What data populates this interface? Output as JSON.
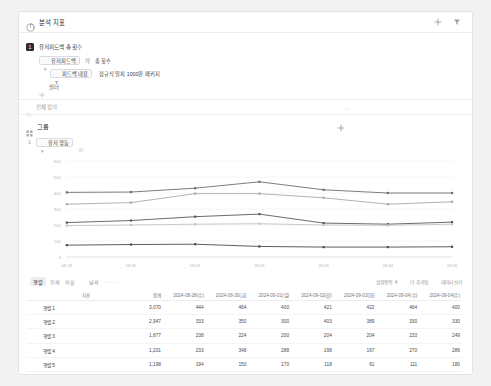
{
  "header": {
    "title": "분석 지표",
    "chart_icon": "chart-icon",
    "add_label": "+",
    "settings_icon": "funnel-icon"
  },
  "event": {
    "badge": "1",
    "title": "유저피드백 총 횟수",
    "property_chip": "유저피드백",
    "operator": "의",
    "metric": "총 횟수",
    "filter_chip": "피드백 내용",
    "filter_value": "정규식 일치 1000원 패키지",
    "add_filter_label": "필터"
  },
  "definition": {
    "label": "전체 정의",
    "icon": "search-icon",
    "caret": "chevron-down-icon"
  },
  "group": {
    "title": "그룹",
    "icon": "grid-icon",
    "add_label": "+",
    "items": [
      {
        "num": "1",
        "chip": "유저 행동",
        "gear": "gear-icon"
      }
    ]
  },
  "table_toolbar": {
    "tab": "행렬",
    "opt1": "전체",
    "opt2": "비율",
    "opt3": "날짜",
    "dots": "· · · · ·",
    "right": [
      "상위항목: 4",
      "더 추가됨",
      "데이터 보기"
    ]
  },
  "table": {
    "columns": [
      "",
      "지표",
      "합계",
      "2024-08-28(수)",
      "2024-08-30(금)",
      "2024-09-01(일)",
      "2024-09-02(월)",
      "2024-09-03(화)",
      "2024-09-04(수)",
      "2024-09-04(수)"
    ],
    "rows": [
      {
        "name": "행렬 1",
        "total": "3,070",
        "values": [
          "444",
          "464",
          "400",
          "421",
          "422",
          "464",
          "400"
        ]
      },
      {
        "name": "행렬 2",
        "total": "2,947",
        "values": [
          "333",
          "350",
          "300",
          "403",
          "389",
          "330",
          "330"
        ]
      },
      {
        "name": "행렬 3",
        "total": "1,877",
        "values": [
          "238",
          "224",
          "200",
          "204",
          "204",
          "233",
          "249"
        ]
      },
      {
        "name": "행렬 4",
        "total": "1,201",
        "values": [
          "233",
          "348",
          "288",
          "198",
          "167",
          "270",
          "289"
        ]
      },
      {
        "name": "행렬 5",
        "total": "1,198",
        "values": [
          "194",
          "150",
          "170",
          "118",
          "61",
          "111",
          "180"
        ]
      }
    ]
  },
  "chart_data": {
    "type": "line",
    "title": "",
    "xlabel": "",
    "ylabel": "",
    "grid": true,
    "legend": "none",
    "x": [
      "08-28",
      "08-30",
      "09-01",
      "09-02",
      "09-03",
      "09-04",
      "09-05"
    ],
    "ylim": [
      0,
      600
    ],
    "yticks": [
      0,
      100,
      200,
      300,
      400,
      500,
      600
    ],
    "ytick_labels": [
      "0",
      "100",
      "200",
      "300",
      "400",
      "500",
      "600"
    ],
    "series": [
      {
        "name": "행렬 1",
        "color": "#6b6b73",
        "values": [
          404,
          406,
          430,
          470,
          420,
          400,
          400
        ]
      },
      {
        "name": "행렬 2",
        "color": "#a8a8b0",
        "values": [
          330,
          340,
          396,
          396,
          370,
          330,
          345
        ]
      },
      {
        "name": "행렬 3",
        "color": "#57575f",
        "values": [
          215,
          228,
          252,
          268,
          212,
          205,
          218
        ]
      },
      {
        "name": "행렬 4",
        "color": "#c2c2c8",
        "values": [
          196,
          200,
          205,
          208,
          200,
          198,
          205
        ]
      },
      {
        "name": "행렬 5",
        "color": "#4a4a52",
        "values": [
          74,
          78,
          80,
          66,
          62,
          62,
          64
        ]
      }
    ]
  }
}
